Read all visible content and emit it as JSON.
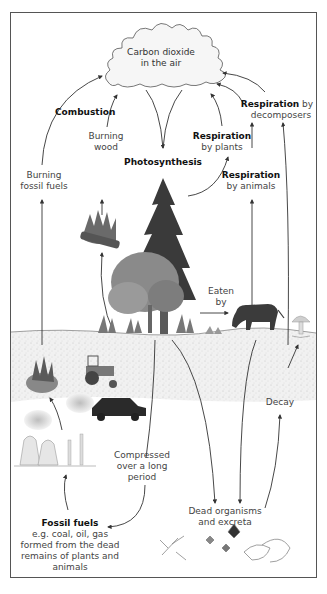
{
  "diagram": {
    "type": "carbon-cycle",
    "nodes": {
      "co2": {
        "line1": "Carbon dioxide",
        "line2": "in the air"
      },
      "combustion": {
        "label": "Combustion"
      },
      "burning_wood": {
        "line1": "Burning",
        "line2": "wood"
      },
      "burning_fossil": {
        "line1": "Burning",
        "line2": "fossil fuels"
      },
      "photosynthesis": {
        "label": "Photosynthesis"
      },
      "resp_plants": {
        "bold": "Respiration",
        "rest": "by plants"
      },
      "resp_animals": {
        "bold": "Respiration",
        "rest": "by animals"
      },
      "resp_decomposers": {
        "bold": "Respiration",
        "rest_inline": " by",
        "rest": "decomposers"
      },
      "eaten_by": {
        "line1": "Eaten",
        "line2": "by"
      },
      "decay": {
        "label": "Decay"
      },
      "compressed": {
        "line1": "Compressed",
        "line2": "over a long",
        "line3": "period"
      },
      "dead_organisms": {
        "line1": "Dead organisms",
        "line2": "and excreta"
      },
      "fossil_fuels": {
        "title": "Fossil fuels",
        "line1": "e.g. coal, oil, gas",
        "line2": "formed from the dead",
        "line3": "remains of plants and",
        "line4": "animals"
      }
    },
    "illustrations": [
      "cloud",
      "conifer-tree",
      "deciduous-tree",
      "burning-wood",
      "cow",
      "mushroom",
      "burning-fuel",
      "tractor",
      "car",
      "power-station",
      "dead-leaves",
      "animal-skull",
      "ferns"
    ],
    "colors": {
      "frame": "#555555",
      "arrow": "#333333",
      "soil": "#ececec",
      "tree_dark": "#3a3a3a",
      "tree_mid": "#7a7a7a",
      "cow": "#3b3b3b",
      "fire": "#6a6a6a"
    }
  }
}
